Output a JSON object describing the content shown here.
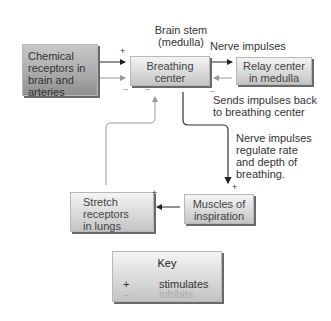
{
  "title_label": {
    "line1": "Brain stem",
    "line2": "(medulla)"
  },
  "nodes": {
    "chemical_receptors": {
      "lines": [
        "Chemical",
        "receptors in",
        "brain and",
        "arteries"
      ]
    },
    "breathing_center": {
      "lines": [
        "Breathing",
        "center"
      ]
    },
    "relay_center": {
      "lines": [
        "Relay center",
        "in medulla"
      ]
    },
    "muscles": {
      "lines": [
        "Muscles of",
        "inspiration"
      ]
    },
    "stretch_receptors": {
      "lines": [
        "Stretch",
        "receptors",
        "in lungs"
      ]
    }
  },
  "edge_labels": {
    "nerve_impulses": "Nerve impulses",
    "sends_back": {
      "line1": "Sends impulses back",
      "line2": "to breathing center"
    },
    "regulate": {
      "lines": [
        "Nerve impulses",
        "regulate rate",
        "and depth of",
        "breathing."
      ]
    }
  },
  "signs": {
    "plus": "+",
    "minus": "–"
  },
  "key": {
    "title": "Key",
    "items": [
      {
        "symbol": "+",
        "label": "stimulates"
      },
      {
        "symbol": "–",
        "label": "inhibits"
      }
    ]
  },
  "colors": {
    "stimulate_arrow": "#222222",
    "inhibit_arrow": "#999999"
  }
}
